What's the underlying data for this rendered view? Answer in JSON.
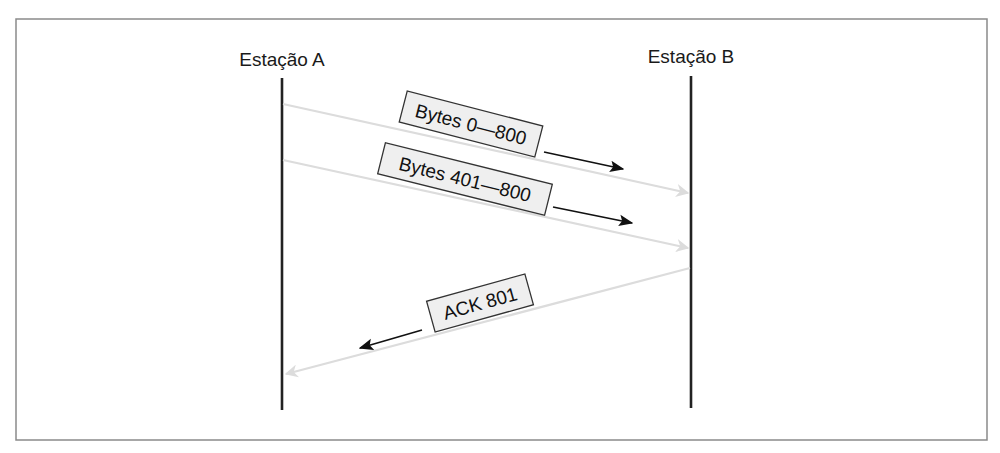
{
  "diagram": {
    "type": "sequence-diagram",
    "colors": {
      "frame": "#8a8a8a",
      "lifeline": "#222222",
      "message_line": "#dcdcdc",
      "direction_arrow": "#111111",
      "label_fill": "#efefef",
      "label_border": "#333333"
    },
    "stations": [
      {
        "id": "A",
        "label": "Estação A"
      },
      {
        "id": "B",
        "label": "Estação B"
      }
    ],
    "messages": [
      {
        "from": "A",
        "to": "B",
        "label": "Bytes 0—800"
      },
      {
        "from": "A",
        "to": "B",
        "label": "Bytes 401—800"
      },
      {
        "from": "B",
        "to": "A",
        "label": "ACK 801"
      }
    ]
  }
}
